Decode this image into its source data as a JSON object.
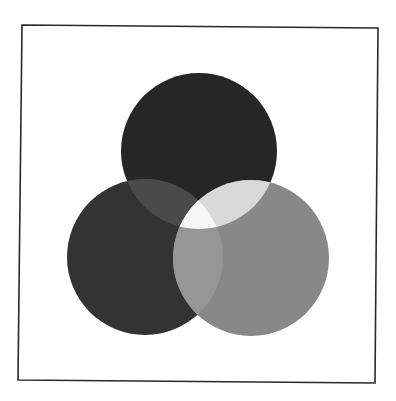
{
  "diagram": {
    "type": "venn",
    "set_count": 3,
    "frame": {
      "points": [
        [
          22,
          25
        ],
        [
          378,
          28
        ],
        [
          375,
          383
        ],
        [
          18,
          380
        ]
      ],
      "stroke": "#2a2a2a",
      "stroke_width": 1.6
    },
    "circles": [
      {
        "id": "top",
        "cx": 199,
        "cy": 151,
        "r": 78,
        "color": "#262626"
      },
      {
        "id": "left",
        "cx": 145,
        "cy": 257,
        "r": 78,
        "color": "#333333"
      },
      {
        "id": "right",
        "cx": 251,
        "cy": 258,
        "r": 78,
        "color": "#888888"
      }
    ],
    "regions": {
      "top_left": "#4a4a4a",
      "top_right": "#d8d8d8",
      "left_right": "#969696",
      "all_three": "#f6f6f6"
    },
    "labels": []
  }
}
